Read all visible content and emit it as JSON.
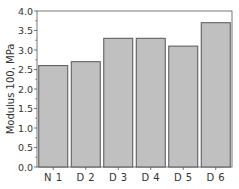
{
  "chart_data": {
    "type": "bar",
    "title": "",
    "xlabel": "",
    "ylabel": "Modulus 100, MPa",
    "categories": [
      "N 1",
      "D 2",
      "D 3",
      "D 4",
      "D 5",
      "D 6"
    ],
    "values": [
      2.6,
      2.7,
      3.3,
      3.3,
      3.1,
      3.7
    ],
    "ylim": [
      0.0,
      4.0
    ],
    "yticks": [
      "0.0",
      "0.5",
      "1.0",
      "1.5",
      "2.0",
      "2.5",
      "3.0",
      "3.5",
      "4.0"
    ],
    "grid": false,
    "legend": null,
    "colors": {
      "bar_fill": "#c0c0c0",
      "bar_stroke": "#555555",
      "axis": "#555555"
    }
  }
}
